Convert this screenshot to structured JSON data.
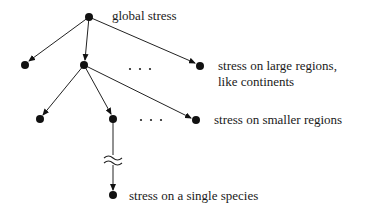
{
  "diagram": {
    "type": "tree",
    "colors": {
      "ink": "#111111",
      "background": "#ffffff"
    },
    "labels": {
      "root": "global stress",
      "level1_line1": "stress on large regions,",
      "level1_line2": "like continents",
      "level2": "stress on smaller regions",
      "leaf": "stress on a single species"
    },
    "ellipsis": "· · ·",
    "break_symbol": "≈",
    "nodes": [
      {
        "id": "root",
        "x": 89,
        "y": 17
      },
      {
        "id": "l1a",
        "x": 25,
        "y": 65
      },
      {
        "id": "l1b",
        "x": 84,
        "y": 65
      },
      {
        "id": "l1c",
        "x": 200,
        "y": 66
      },
      {
        "id": "l2a",
        "x": 40,
        "y": 119
      },
      {
        "id": "l2b",
        "x": 113,
        "y": 119
      },
      {
        "id": "l2c",
        "x": 196,
        "y": 120
      },
      {
        "id": "leaf",
        "x": 113,
        "y": 195
      }
    ],
    "edges": [
      [
        "root",
        "l1a"
      ],
      [
        "root",
        "l1b"
      ],
      [
        "root",
        "l1c"
      ],
      [
        "l1b",
        "l2a"
      ],
      [
        "l1b",
        "l2b"
      ],
      [
        "l1b",
        "l2c"
      ],
      [
        "l2b",
        "leaf"
      ]
    ]
  }
}
